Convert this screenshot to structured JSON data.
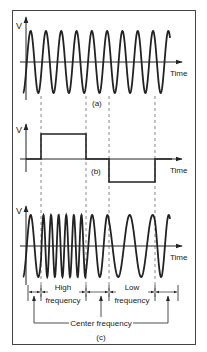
{
  "panels": {
    "a": {
      "caption": "(a)",
      "y_axis_label": "V",
      "x_axis_label": "Time",
      "description": "Carrier / center-frequency sine wave"
    },
    "b": {
      "caption": "(b)",
      "y_axis_label": "V",
      "x_axis_label": "Time",
      "description": "Modulating square-wave signal: positive pulse then negative pulse",
      "levels": [
        "0",
        "+",
        "0",
        "-",
        "0"
      ]
    },
    "c": {
      "caption": "(c)",
      "y_axis_label": "V",
      "x_axis_label": "Time",
      "description": "Frequency-modulated output wave",
      "segments": [
        {
          "label_line1": "High",
          "label_line2": "frequency"
        },
        {
          "label_line1": "Low",
          "label_line2": "frequency"
        }
      ],
      "center_label": "Center frequency"
    }
  },
  "colors": {
    "line": "#222222",
    "dashed": "#555555",
    "frame": "#444444",
    "background": "#ffffff"
  }
}
